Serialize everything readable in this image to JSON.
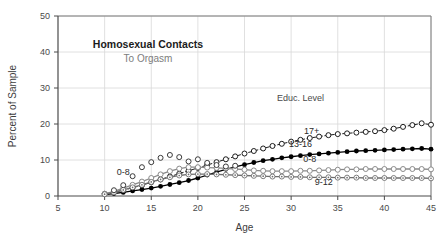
{
  "chart_data": {
    "type": "line",
    "title": "Homosexual Contacts",
    "subtitle": "To Orgasm",
    "xlabel": "Age",
    "ylabel": "Percent of Sample",
    "xlim": [
      5,
      45
    ],
    "ylim": [
      0,
      50
    ],
    "xticks": [
      5,
      10,
      15,
      20,
      25,
      30,
      35,
      40,
      45
    ],
    "yticks": [
      0,
      10,
      20,
      30,
      40,
      50
    ],
    "grid": true,
    "legend_position": "inline-annotations",
    "annotations": [
      {
        "text": "Educ. Level",
        "x": 31,
        "y": 26.5
      },
      {
        "text": "17+",
        "x": 32.2,
        "y": 17.2
      },
      {
        "text": "13-16",
        "x": 31.0,
        "y": 13.6
      },
      {
        "text": "0-8",
        "x": 32.0,
        "y": 9.4
      },
      {
        "text": "9-12",
        "x": 33.5,
        "y": 3.0
      },
      {
        "text": "0-8",
        "x": 12.0,
        "y": 5.9
      }
    ],
    "series": [
      {
        "name": "17+",
        "marker": "open-circle",
        "line": "dashed",
        "color": "#1b1b1b",
        "x": [
          10,
          11,
          12,
          13,
          14,
          15,
          16,
          17,
          18,
          19,
          20,
          21,
          22,
          23,
          24,
          25,
          26,
          27,
          28,
          29,
          30,
          31,
          32,
          33,
          34,
          35,
          36,
          37,
          38,
          39,
          40,
          41,
          42,
          43,
          44,
          45
        ],
        "y": [
          0.6,
          1.0,
          1.6,
          2.3,
          3.0,
          3.8,
          4.6,
          5.4,
          6.2,
          7.0,
          7.8,
          8.6,
          9.4,
          10.2,
          11.0,
          11.8,
          12.5,
          13.2,
          13.9,
          14.5,
          15.1,
          15.6,
          16.1,
          16.5,
          16.9,
          17.2,
          17.4,
          17.6,
          17.8,
          18.0,
          18.3,
          18.7,
          19.2,
          19.7,
          20.2,
          19.8
        ]
      },
      {
        "name": "13-16",
        "marker": "filled-circle",
        "line": "solid",
        "color": "#000000",
        "x": [
          10,
          11,
          12,
          13,
          14,
          15,
          16,
          17,
          18,
          19,
          20,
          21,
          22,
          23,
          24,
          25,
          26,
          27,
          28,
          29,
          30,
          31,
          32,
          33,
          34,
          35,
          36,
          37,
          38,
          39,
          40,
          41,
          42,
          43,
          44,
          45
        ],
        "y": [
          0.4,
          0.7,
          1.0,
          1.4,
          1.8,
          2.2,
          2.7,
          3.2,
          3.7,
          4.3,
          5.0,
          5.8,
          6.6,
          7.4,
          8.1,
          8.7,
          9.3,
          9.8,
          10.2,
          10.6,
          10.9,
          11.2,
          11.5,
          11.7,
          11.9,
          12.1,
          12.3,
          12.5,
          12.6,
          12.7,
          12.8,
          12.9,
          13.0,
          13.1,
          13.2,
          13.0
        ]
      },
      {
        "name": "0-8",
        "marker": "open-circle",
        "line": "solid",
        "color": "#8a8a8a",
        "x": [
          10,
          11,
          12,
          13,
          14,
          15,
          16,
          17,
          18,
          19,
          20,
          21,
          22,
          23,
          24,
          25,
          26,
          27,
          28,
          29,
          30,
          31,
          32,
          33,
          34,
          35,
          36,
          37,
          38,
          39,
          40,
          41,
          42,
          43,
          44,
          45
        ],
        "y": [
          0.6,
          1.3,
          2.2,
          3.1,
          4.0,
          5.0,
          6.0,
          6.9,
          7.6,
          8.0,
          8.0,
          7.9,
          7.8,
          7.7,
          7.5,
          7.3,
          7.1,
          7.0,
          6.9,
          6.9,
          6.9,
          7.0,
          7.0,
          7.1,
          7.2,
          7.3,
          7.4,
          7.4,
          7.5,
          7.5,
          7.5,
          7.5,
          7.5,
          7.5,
          7.5,
          7.4
        ]
      },
      {
        "name": "9-12",
        "marker": "open-circle-dot",
        "line": "solid",
        "color": "#6e6e6e",
        "x": [
          10,
          11,
          12,
          13,
          14,
          15,
          16,
          17,
          18,
          19,
          20,
          21,
          22,
          23,
          24,
          25,
          26,
          27,
          28,
          29,
          30,
          31,
          32,
          33,
          34,
          35,
          36,
          37,
          38,
          39,
          40,
          41,
          42,
          43,
          44,
          45
        ],
        "y": [
          0.5,
          1.0,
          1.7,
          2.4,
          3.1,
          3.9,
          4.6,
          5.2,
          5.7,
          6.0,
          6.1,
          6.1,
          6.0,
          5.9,
          5.8,
          5.7,
          5.6,
          5.5,
          5.4,
          5.4,
          5.3,
          5.3,
          5.2,
          5.2,
          5.2,
          5.1,
          5.1,
          5.1,
          5.0,
          5.0,
          5.0,
          5.0,
          5.0,
          5.0,
          5.0,
          4.9
        ]
      },
      {
        "name": "0-8 scatter",
        "marker": "open-circle",
        "line": "none",
        "color": "#3a3a3a",
        "x": [
          11,
          12,
          13,
          14,
          15,
          16,
          17,
          18,
          19,
          20,
          21,
          22,
          23,
          24
        ],
        "y": [
          1.6,
          3.0,
          5.5,
          8.0,
          9.4,
          10.6,
          11.4,
          10.8,
          9.6,
          10.2,
          9.2,
          8.6,
          8.2,
          8.4
        ]
      }
    ]
  }
}
